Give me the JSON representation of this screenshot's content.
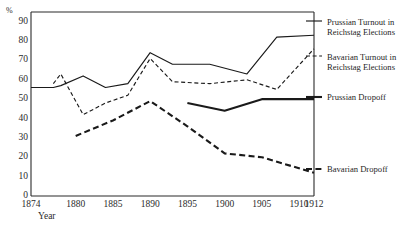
{
  "chart_data": {
    "type": "line",
    "title": "",
    "xlabel": "Year",
    "ylabel": "%",
    "ylim": [
      0,
      95
    ],
    "xlim": [
      1874,
      1912
    ],
    "grid": false,
    "legend_position": "right",
    "ytick_labels": [
      "90",
      "80",
      "70",
      "60",
      "50",
      "40",
      "30",
      "20",
      "10",
      "0"
    ],
    "ytick_values": [
      90,
      80,
      70,
      60,
      50,
      40,
      30,
      20,
      10,
      0
    ],
    "xtick_labels": [
      "1874",
      "1880",
      "1885",
      "1890",
      "1895",
      "1900",
      "1905",
      "1910",
      "1912"
    ],
    "xtick_values": [
      1874,
      1880,
      1885,
      1890,
      1895,
      1900,
      1905,
      1910,
      1912
    ],
    "series": [
      {
        "name": "Prussian Turnout in Reichstag Elections",
        "style": "solid-thin",
        "x": [
          1874,
          1877,
          1878,
          1881,
          1884,
          1887,
          1890,
          1893,
          1898,
          1903,
          1907,
          1912
        ],
        "values": [
          56,
          56,
          57,
          62,
          56,
          58,
          74,
          68,
          68,
          63,
          82,
          83
        ]
      },
      {
        "name": "Bavarian Turnout in Reichstag Elections",
        "style": "dashed-thin",
        "x": [
          1877,
          1878,
          1881,
          1884,
          1887,
          1890,
          1893,
          1898,
          1903,
          1907,
          1912
        ],
        "values": [
          58,
          63,
          42,
          48,
          52,
          71,
          59,
          58,
          60,
          55,
          76
        ]
      },
      {
        "name": "Prussian Dropoff",
        "style": "solid-thick",
        "x": [
          1895,
          1900,
          1905,
          1912
        ],
        "values": [
          48,
          44,
          50,
          50
        ]
      },
      {
        "name": "Bavarian Dropoff",
        "style": "dashed-thick",
        "x": [
          1880,
          1885,
          1890,
          1895,
          1900,
          1905,
          1912
        ],
        "values": [
          31,
          39,
          49,
          36,
          22,
          20,
          12
        ]
      }
    ]
  },
  "legend": [
    {
      "id": "prussian-turnout",
      "label": "Prussian Turnout in\nReichstag Elections",
      "style": "solid-thin"
    },
    {
      "id": "bavarian-turnout",
      "label": "Bavarian Turnout in\nReichstag Elections",
      "style": "dashed-thin"
    },
    {
      "id": "prussian-dropoff",
      "label": "Prussian Dropoff",
      "style": "solid-thick"
    },
    {
      "id": "bavarian-dropoff",
      "label": "Bavarian Dropoff",
      "style": "dashed-thick"
    }
  ],
  "colors": {
    "line": "#1a1a1a",
    "axis": "#2b2b2b",
    "background": "#ffffff"
  }
}
